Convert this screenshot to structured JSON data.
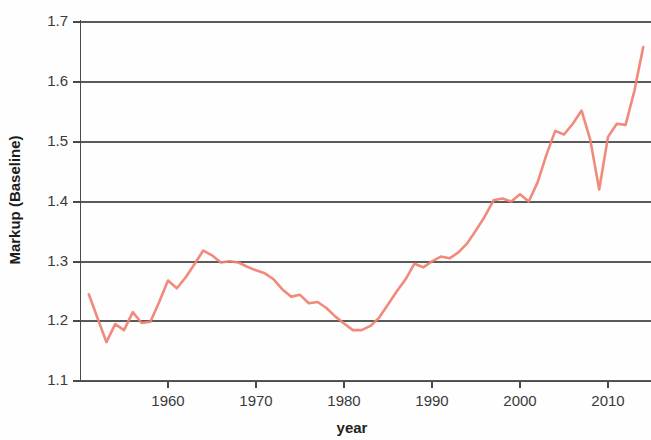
{
  "chart_data": {
    "type": "line",
    "title": "",
    "xlabel": "year",
    "ylabel": "Markup (Baseline)",
    "xlim": [
      1951,
      1955
    ],
    "x_axis_range": [
      1950.7,
      1915.0
    ],
    "ylim": [
      1.1,
      1.7
    ],
    "xticks": [
      1960,
      1970,
      1980,
      1990,
      2000,
      2010
    ],
    "xtick_labels": [
      "1960",
      "1970",
      "1980",
      "1990",
      "2000",
      "2010"
    ],
    "yticks": [
      1.1,
      1.2,
      1.3,
      1.4,
      1.5,
      1.6,
      1.7
    ],
    "ytick_labels": [
      "1.1",
      "1.2",
      "1.3",
      "1.4",
      "1.5",
      "1.6",
      "1.7"
    ],
    "grid": true,
    "grid_axis": "y",
    "legend": false,
    "line_color": "#F08070",
    "series": [
      {
        "name": "Markup (Baseline)",
        "x": [
          1951,
          1952,
          1953,
          1954,
          1955,
          1956,
          1957,
          1958,
          1959,
          1960,
          1961,
          1962,
          1963,
          1964,
          1965,
          1966,
          1967,
          1968,
          1969,
          1970,
          1971,
          1972,
          1973,
          1974,
          1975,
          1976,
          1977,
          1978,
          1979,
          1980,
          1981,
          1982,
          1983,
          1984,
          1985,
          1986,
          1987,
          1988,
          1989,
          1990,
          1991,
          1992,
          1993,
          1994,
          1995,
          1996,
          1997,
          1998,
          1999,
          2000,
          2001,
          2002,
          2003,
          2004,
          2005,
          2006,
          2007,
          2008,
          2009,
          2010,
          2011,
          2012,
          2013,
          2014
        ],
        "values": [
          1.245,
          1.205,
          1.165,
          1.195,
          1.185,
          1.215,
          1.197,
          1.199,
          1.232,
          1.268,
          1.255,
          1.273,
          1.295,
          1.318,
          1.31,
          1.298,
          1.3,
          1.298,
          1.291,
          1.285,
          1.28,
          1.27,
          1.253,
          1.241,
          1.244,
          1.23,
          1.232,
          1.222,
          1.208,
          1.196,
          1.185,
          1.185,
          1.192,
          1.206,
          1.228,
          1.25,
          1.27,
          1.296,
          1.29,
          1.3,
          1.308,
          1.305,
          1.315,
          1.33,
          1.352,
          1.375,
          1.402,
          1.405,
          1.4,
          1.412,
          1.4,
          1.432,
          1.478,
          1.518,
          1.512,
          1.53,
          1.552,
          1.502,
          1.42,
          1.508,
          1.53,
          1.528,
          1.585,
          1.658
        ]
      }
    ]
  }
}
